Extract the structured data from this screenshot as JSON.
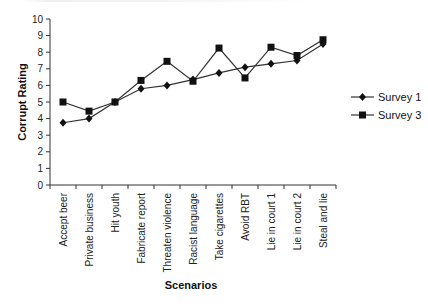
{
  "chart_data": {
    "type": "line",
    "title": "",
    "xlabel": "Scenarios",
    "ylabel": "Corrupt Rating",
    "ylim": [
      0,
      10
    ],
    "yticks": [
      0,
      1,
      2,
      3,
      4,
      5,
      6,
      7,
      8,
      9,
      10
    ],
    "grid": false,
    "legend_position": "right",
    "categories": [
      "Accept beer",
      "Private business",
      "Hit youth",
      "Fabricate report",
      "Threaten violence",
      "Racist language",
      "Take cigarettes",
      "Avoid RBT",
      "Lie in court 1",
      "Lie in court 2",
      "Steal and lie"
    ],
    "series": [
      {
        "name": "Survey 1",
        "marker": "diamond",
        "values": [
          3.75,
          4.0,
          5.0,
          5.8,
          6.0,
          6.35,
          6.75,
          7.1,
          7.3,
          7.5,
          8.5
        ]
      },
      {
        "name": "Survey 3",
        "marker": "square",
        "values": [
          5.0,
          4.45,
          5.0,
          6.3,
          7.45,
          6.25,
          8.25,
          6.45,
          8.3,
          7.8,
          8.75
        ]
      }
    ]
  },
  "colors": {
    "line": "#333333",
    "marker": "#111111",
    "axis": "#333333"
  }
}
